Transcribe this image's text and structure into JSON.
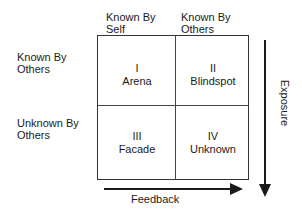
{
  "diagram": {
    "column_headers": [
      {
        "line1": "Known By",
        "line2": "Self"
      },
      {
        "line1": "Known By",
        "line2": "Others"
      }
    ],
    "row_headers": [
      {
        "line1": "Known By",
        "line2": "Others"
      },
      {
        "line1": "Unknown By",
        "line2": "Others"
      }
    ],
    "quadrants": [
      {
        "numeral": "I",
        "name": "Arena"
      },
      {
        "numeral": "II",
        "name": "Blindspot"
      },
      {
        "numeral": "III",
        "name": "Facade"
      },
      {
        "numeral": "IV",
        "name": "Unknown"
      }
    ],
    "axes": {
      "vertical_arrow_label": "Exposure",
      "horizontal_arrow_label": "Feedback"
    }
  }
}
